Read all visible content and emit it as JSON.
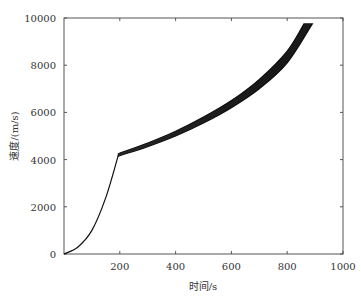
{
  "chart_data": {
    "type": "line",
    "title": "",
    "xlabel": "时间/s",
    "ylabel": "速度/(m/s)",
    "xlim": [
      0,
      1000
    ],
    "ylim": [
      0,
      10000
    ],
    "x_ticks": [
      "200",
      "400",
      "600",
      "800",
      "1000"
    ],
    "y_ticks": [
      "0",
      "2000",
      "4000",
      "6000",
      "8000",
      "10000"
    ],
    "grid": false,
    "legend": null,
    "series": [
      {
        "name": "ascent-phase",
        "x": [
          0,
          50,
          100,
          150,
          195
        ],
        "values": [
          0,
          300,
          1000,
          2400,
          4200
        ]
      },
      {
        "name": "dispersion-band-upper",
        "x": [
          195,
          300,
          400,
          500,
          600,
          700,
          800,
          860
        ],
        "values": [
          4250,
          4700,
          5200,
          5800,
          6500,
          7400,
          8600,
          9750
        ]
      },
      {
        "name": "dispersion-band-lower",
        "x": [
          195,
          300,
          400,
          500,
          600,
          700,
          800,
          890
        ],
        "values": [
          4150,
          4550,
          5000,
          5550,
          6200,
          7000,
          8100,
          9750
        ]
      }
    ]
  },
  "axes": {
    "xlabel": "时间/s",
    "ylabel": "速度/(m/s)"
  }
}
